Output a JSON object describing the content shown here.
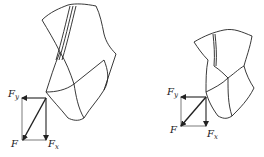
{
  "diagrams": [
    {
      "name": "left-drill-bit",
      "labels": {
        "F": "F",
        "Fy_base": "F",
        "Fy_sub": "y",
        "Fx_base": "F",
        "Fx_sub": "x"
      }
    },
    {
      "name": "right-drill-bit",
      "labels": {
        "F": "F",
        "Fy_base": "F",
        "Fy_sub": "y",
        "Fx_base": "F",
        "Fx_sub": "x"
      }
    }
  ],
  "colors": {
    "stroke": "#222222",
    "background": "#ffffff"
  }
}
